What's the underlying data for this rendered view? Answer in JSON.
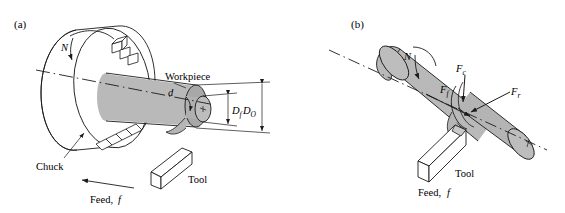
{
  "figure": {
    "title_visible": false,
    "background": "#ffffff",
    "stroke": "#1a1a1a",
    "fill_body": "#b9b9b9",
    "fill_body_dark": "#a3a3a3",
    "fill_face": "#c9c9c9",
    "fill_white": "#ffffff"
  },
  "panels": [
    {
      "key": "a",
      "label": "(a)",
      "labels": {
        "rotation": "N",
        "workpiece": "Workpiece",
        "chuck": "Chuck",
        "tool": "Tool",
        "feed": "Feed,",
        "feed_symbol": "f",
        "depth_of_cut": "d",
        "diameter_final": "D",
        "diameter_final_sub": "f",
        "diameter_original": "D",
        "diameter_original_sub": "O"
      }
    },
    {
      "key": "b",
      "label": "(b)",
      "labels": {
        "rotation": "N",
        "tool": "Tool",
        "feed": "Feed,",
        "feed_symbol": "f",
        "force_cutting": "F",
        "force_cutting_sub": "c",
        "force_feed": "F",
        "force_feed_sub": "f",
        "force_radial": "F",
        "force_radial_sub": "r"
      }
    }
  ]
}
